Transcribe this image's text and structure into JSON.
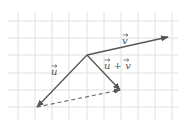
{
  "figure": {
    "type": "vector-addition-diagram",
    "grid": {
      "x_lines": [
        18,
        35,
        52,
        69,
        87,
        104,
        121,
        138,
        155,
        172
      ],
      "y_lines": [
        21,
        38,
        55,
        73,
        90,
        107
      ],
      "x_extent": [
        8,
        178
      ],
      "y_extent": [
        12,
        120
      ],
      "color": "#e0e0e0"
    },
    "origin": {
      "x": 87,
      "y": 55
    },
    "vectors": [
      {
        "id": "v",
        "label": "v",
        "from": [
          87,
          55
        ],
        "to": [
          168,
          37
        ],
        "style": "solid",
        "color": "#555555"
      },
      {
        "id": "u",
        "label": "u",
        "from": [
          87,
          55
        ],
        "to": [
          37,
          107
        ],
        "style": "solid",
        "color": "#555555"
      },
      {
        "id": "u_plus_v",
        "label": "u + v",
        "from": [
          87,
          55
        ],
        "to": [
          120,
          90
        ],
        "style": "solid",
        "color": "#555555"
      },
      {
        "id": "translated_v",
        "label": "",
        "from": [
          37,
          107
        ],
        "to": [
          120,
          90
        ],
        "style": "dashed",
        "color": "#666666"
      }
    ],
    "labels": {
      "v": {
        "text": "v",
        "x": 122,
        "y": 44
      },
      "u": {
        "text": "u",
        "x": 51,
        "y": 75
      },
      "u_plus_v": {
        "text": "u + v",
        "x": 104,
        "y": 69
      }
    }
  }
}
